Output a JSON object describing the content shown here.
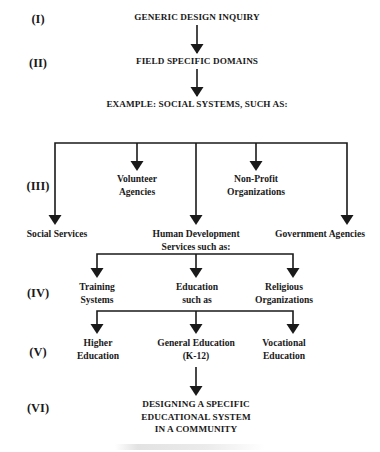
{
  "levels": [
    {
      "id": "I",
      "label": "(I)"
    },
    {
      "id": "II",
      "label": "(II)"
    },
    {
      "id": "III",
      "label": "(III)"
    },
    {
      "id": "IV",
      "label": "(IV)"
    },
    {
      "id": "V",
      "label": "(V)"
    },
    {
      "id": "VI",
      "label": "(VI)"
    }
  ],
  "nodes": {
    "generic": "GENERIC DESIGN INQUIRY",
    "field": "FIELD SPECIFIC DOMAINS",
    "example": "EXAMPLE: SOCIAL SYSTEMS, SUCH AS:",
    "level3": {
      "social_services": "Social Services",
      "volunteer": [
        "Volunteer",
        "Agencies"
      ],
      "human_dev": [
        "Human Development",
        "Services such as:"
      ],
      "nonprofit": [
        "Non-Profit",
        "Organizations"
      ],
      "government": "Government Agencies"
    },
    "level4": {
      "training": [
        "Training",
        "Systems"
      ],
      "education": [
        "Education",
        "such as"
      ],
      "religious": [
        "Religious",
        "Organizations"
      ]
    },
    "level5": {
      "higher": [
        "Higher",
        "Education"
      ],
      "general": [
        "General Education",
        "(K-12)"
      ],
      "vocational": [
        "Vocational",
        "Education"
      ]
    },
    "final": [
      "DESIGNING A SPECIFIC",
      "EDUCATIONAL SYSTEM",
      "IN A COMMUNITY"
    ]
  },
  "colors": {
    "line": "#1a1a1a",
    "text": "#1a1a1a",
    "background": "#ffffff"
  }
}
